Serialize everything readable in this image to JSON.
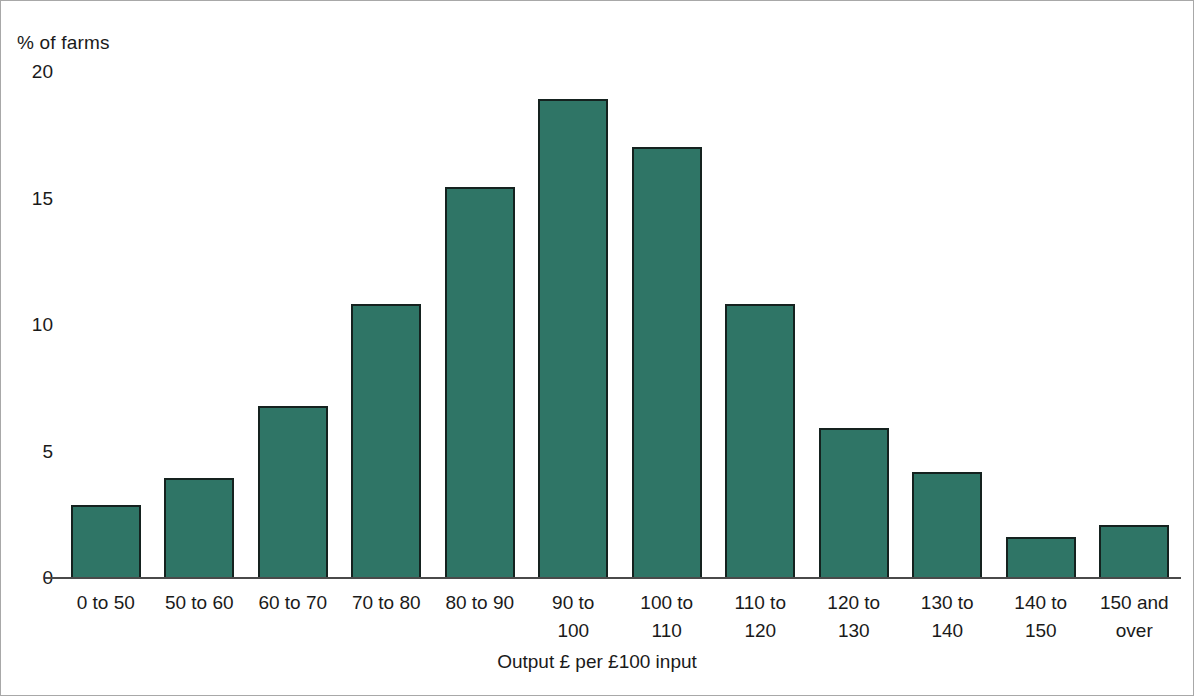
{
  "chart_data": {
    "type": "bar",
    "title": "",
    "subtitle": "",
    "ylabel": "% of farms",
    "xlabel": "Output £ per £100 input",
    "categories": [
      "0 to 50",
      "50 to 60",
      "60 to 70",
      "70 to 80",
      "80 to 90",
      "90 to\n100",
      "100 to\n110",
      "110 to\n120",
      "120 to\n130",
      "130 to\n140",
      "140 to\n150",
      "150 and\nover"
    ],
    "values": [
      2.85,
      3.9,
      6.75,
      10.8,
      15.4,
      18.9,
      17.0,
      10.8,
      5.9,
      4.15,
      1.6,
      2.05
    ],
    "ylim": [
      0,
      20
    ],
    "yticks": [
      0,
      5,
      10,
      15,
      20
    ],
    "ytick_labels": [
      "0",
      "5",
      "10",
      "15",
      "20"
    ],
    "grid": false,
    "legend": null,
    "bar_color": "#2f7566",
    "bar_edge_color": "#15221f",
    "axis_color": "#4a4a4a",
    "background": "#ffffff",
    "frame_color": "#a8a8a8"
  }
}
